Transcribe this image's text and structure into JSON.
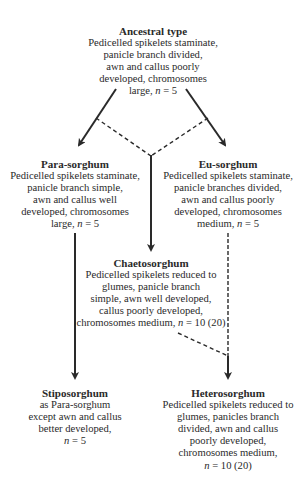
{
  "nodes": {
    "ancestral": {
      "title": "Ancestral type",
      "lines": [
        "Pedicelled spikelets staminate,",
        "panicle branch divided,",
        "awn and callus poorly",
        "developed, chromosomes",
        "large, n = 5"
      ]
    },
    "para": {
      "title": "Para-sorghum",
      "lines": [
        "Pedicelled spikelets staminate,",
        "panicle branch simple,",
        "awn and callus well",
        "developed, chromosomes",
        "large, n = 5"
      ]
    },
    "eu": {
      "title": "Eu-sorghum",
      "lines": [
        "Pedicelled spikelets staminate,",
        "panicle branches divided,",
        "awn and callus poorly",
        "developed, chromosomes",
        "medium, n = 5"
      ]
    },
    "chaeto": {
      "title": "Chaetosorghum",
      "lines": [
        "Pedicelled spikelets reduced to",
        "glumes, panicle branch",
        "simple, awn well developed,",
        "callus poorly developed,",
        "chromosomes medium, n = 10 (20)"
      ]
    },
    "stipo": {
      "title": "Stiposorghum",
      "lines": [
        "as Para-sorghum",
        "except awn and callus",
        "better developed,",
        "n = 5"
      ]
    },
    "hetero": {
      "title": "Heterosorghum",
      "lines": [
        "Pedicelled spikelets reduced to",
        "glumes, panicles branch",
        "divided, awn and callus",
        "poorly developed,",
        "chromosomes medium,",
        "n = 10 (20)"
      ]
    }
  },
  "edges": [
    {
      "from": "ancestral",
      "to": "para",
      "style": "solid",
      "arrow": true
    },
    {
      "from": "ancestral",
      "to": "eu",
      "style": "solid",
      "arrow": true
    },
    {
      "from": "ancestral-left-branch",
      "to": "chaeto",
      "style": "dashed",
      "arrow": false
    },
    {
      "from": "ancestral-right-branch",
      "to": "chaeto",
      "style": "dashed",
      "arrow": false
    },
    {
      "from": "dashed-junction",
      "to": "chaeto",
      "style": "solid",
      "arrow": true
    },
    {
      "from": "para",
      "to": "stipo",
      "style": "solid",
      "arrow": true
    },
    {
      "from": "eu",
      "to": "hetero",
      "style": "dashed",
      "arrow": true
    },
    {
      "from": "chaeto",
      "to": "hetero",
      "style": "dashed",
      "arrow": false
    }
  ],
  "colors": {
    "line": "#2a2a2a",
    "text": "#2a2a2a",
    "background": "#ffffff"
  }
}
